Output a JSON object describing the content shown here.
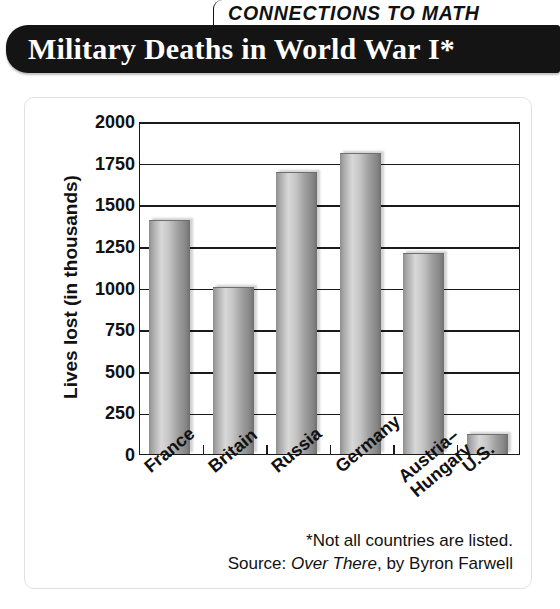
{
  "header": {
    "kicker": "CONNECTIONS TO MATH",
    "title": "Military Deaths in World War I*"
  },
  "footnotes": {
    "asterisk_note": "*Not all countries are listed.",
    "source_prefix": "Source: ",
    "source_title": "Over There",
    "source_suffix": ", by Byron Farwell"
  },
  "chart_data": {
    "type": "bar",
    "title": "Military Deaths in World War I*",
    "xlabel": "",
    "ylabel": "Lives lost (in thousands)",
    "ylim": [
      0,
      2000
    ],
    "yticks": [
      0,
      250,
      500,
      750,
      1000,
      1250,
      1500,
      1750,
      2000
    ],
    "ytick_labels": [
      "0",
      "250",
      "500",
      "750",
      "1000",
      "1250",
      "1500",
      "1750",
      "2000"
    ],
    "grid": true,
    "legend": false,
    "categories": [
      "France",
      "Britain",
      "Russia",
      "Germany",
      "Austria–\nHungary",
      "U.S."
    ],
    "category_labels": [
      "France",
      "Britain",
      "Russia",
      "Germany",
      "Austria–Hungary",
      "U.S."
    ],
    "values": [
      1400,
      1000,
      1690,
      1800,
      1200,
      115
    ],
    "units": "thousands of lives lost",
    "bar_style": "cylinder-3d-gray"
  },
  "colors": {
    "banner_background": "#141414",
    "banner_text": "#ffffff",
    "axis": "#1a1a1a",
    "bar_light": "#d8d8d8",
    "bar_dark": "#6f6f6f",
    "page_background": "#ffffff"
  }
}
